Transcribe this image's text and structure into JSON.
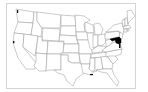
{
  "map": {
    "title": "United States map",
    "highlighted_states": [
      "Maryland",
      "Delaware"
    ],
    "minor_marks": [
      "Washington (Puget Sound)",
      "Oregon coast",
      "Louisiana coast"
    ],
    "colors": {
      "background": "#ffffff",
      "frame_border": "#d4d4d4",
      "state_fill": "#ffffff",
      "state_border": "#8a8a8a",
      "highlight_fill": "#000000"
    }
  }
}
